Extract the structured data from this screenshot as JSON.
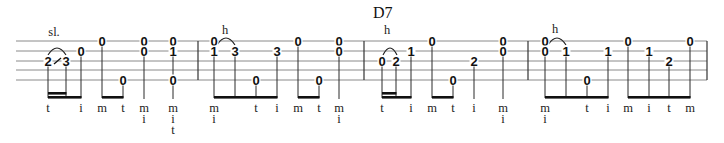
{
  "chord_symbol": {
    "label": "D7",
    "x": 373,
    "y": 18
  },
  "staff": {
    "x_start": 16,
    "x_end": 707,
    "string_y": [
      41,
      51,
      61,
      70,
      80
    ],
    "barlines": [
      198,
      364,
      528,
      707
    ]
  },
  "annotations": [
    {
      "label": "sl.",
      "x": 54,
      "y": 36
    },
    {
      "label": "h",
      "x": 225,
      "y": 34
    },
    {
      "label": "h",
      "x": 387,
      "y": 34
    },
    {
      "label": "h",
      "x": 555,
      "y": 33
    }
  ],
  "slurs": [
    {
      "x1": 48,
      "x2": 66,
      "y": 55,
      "peak": 47
    },
    {
      "x1": 217,
      "x2": 235,
      "y": 45,
      "peak": 37
    },
    {
      "x1": 383,
      "x2": 397,
      "y": 55,
      "peak": 47
    },
    {
      "x1": 548,
      "x2": 566,
      "y": 45,
      "peak": 37
    }
  ],
  "slides": [
    {
      "x1": 54,
      "x2": 61,
      "y1": 64,
      "y2": 58
    }
  ],
  "measures": [
    {
      "index": 1,
      "notes": [
        {
          "x": 48,
          "frets": [
            {
              "string": 3,
              "fret": "2"
            }
          ],
          "fingers": [
            "t"
          ],
          "beam": 1
        },
        {
          "x": 66,
          "frets": [
            {
              "string": 3,
              "fret": "3"
            }
          ],
          "fingers": [],
          "beam": 1
        },
        {
          "x": 81,
          "frets": [
            {
              "string": 2,
              "fret": "0"
            }
          ],
          "fingers": [
            "i"
          ],
          "beam": 1
        },
        {
          "x": 102,
          "frets": [
            {
              "string": 1,
              "fret": "0"
            }
          ],
          "fingers": [
            "m"
          ],
          "beam": 2
        },
        {
          "x": 123,
          "frets": [
            {
              "string": 5,
              "fret": "0"
            }
          ],
          "fingers": [
            "t"
          ],
          "beam": 2
        },
        {
          "x": 144,
          "frets": [
            {
              "string": 1,
              "fret": "0"
            },
            {
              "string": 2,
              "fret": "0"
            }
          ],
          "fingers": [
            "m",
            "i"
          ],
          "beam": 0
        },
        {
          "x": 173,
          "frets": [
            {
              "string": 1,
              "fret": "0"
            },
            {
              "string": 2,
              "fret": "1"
            },
            {
              "string": 5,
              "fret": "0"
            }
          ],
          "fingers": [
            "m",
            "i",
            "t"
          ],
          "beam": 0
        }
      ],
      "beams": [
        {
          "x1": 48,
          "x2": 66,
          "y": 92,
          "thick": 2.6
        },
        {
          "x1": 48,
          "x2": 81,
          "y": 96,
          "thick": 2.6
        },
        {
          "x1": 102,
          "x2": 123,
          "y": 96,
          "thick": 2.6
        }
      ]
    },
    {
      "index": 2,
      "notes": [
        {
          "x": 214,
          "frets": [
            {
              "string": 1,
              "fret": "0"
            },
            {
              "string": 2,
              "fret": "1"
            }
          ],
          "fingers": [
            "m",
            "i"
          ],
          "beam": 1
        },
        {
          "x": 235,
          "frets": [
            {
              "string": 2,
              "fret": "3"
            }
          ],
          "fingers": [],
          "beam": 1
        },
        {
          "x": 256,
          "frets": [
            {
              "string": 5,
              "fret": "0"
            }
          ],
          "fingers": [
            "t"
          ],
          "beam": 1
        },
        {
          "x": 277,
          "frets": [
            {
              "string": 2,
              "fret": "3"
            }
          ],
          "fingers": [
            "i"
          ],
          "beam": 1
        },
        {
          "x": 298,
          "frets": [
            {
              "string": 1,
              "fret": "0"
            }
          ],
          "fingers": [
            "m"
          ],
          "beam": 2
        },
        {
          "x": 319,
          "frets": [
            {
              "string": 5,
              "fret": "0"
            }
          ],
          "fingers": [
            "t"
          ],
          "beam": 2
        },
        {
          "x": 339,
          "frets": [
            {
              "string": 1,
              "fret": "0"
            },
            {
              "string": 2,
              "fret": "0"
            }
          ],
          "fingers": [
            "m",
            "i"
          ],
          "beam": 0
        }
      ],
      "beams": [
        {
          "x1": 214,
          "x2": 277,
          "y": 96,
          "thick": 2.6
        },
        {
          "x1": 298,
          "x2": 319,
          "y": 96,
          "thick": 2.6
        }
      ]
    },
    {
      "index": 3,
      "notes": [
        {
          "x": 382,
          "frets": [
            {
              "string": 3,
              "fret": "0"
            }
          ],
          "fingers": [
            "t"
          ],
          "beam": 1
        },
        {
          "x": 396,
          "frets": [
            {
              "string": 3,
              "fret": "2"
            }
          ],
          "fingers": [],
          "beam": 1
        },
        {
          "x": 411,
          "frets": [
            {
              "string": 2,
              "fret": "1"
            }
          ],
          "fingers": [
            "i"
          ],
          "beam": 1
        },
        {
          "x": 432,
          "frets": [
            {
              "string": 1,
              "fret": "0"
            }
          ],
          "fingers": [
            "m"
          ],
          "beam": 2
        },
        {
          "x": 453,
          "frets": [
            {
              "string": 5,
              "fret": "0"
            }
          ],
          "fingers": [
            "t"
          ],
          "beam": 2
        },
        {
          "x": 474,
          "frets": [
            {
              "string": 3,
              "fret": "2"
            }
          ],
          "fingers": [
            "i"
          ],
          "beam": 0
        },
        {
          "x": 503,
          "frets": [
            {
              "string": 1,
              "fret": "0"
            },
            {
              "string": 2,
              "fret": "0"
            }
          ],
          "fingers": [
            "m",
            "i"
          ],
          "beam": 0
        }
      ],
      "beams": [
        {
          "x1": 382,
          "x2": 396,
          "y": 92,
          "thick": 2.6
        },
        {
          "x1": 382,
          "x2": 411,
          "y": 96,
          "thick": 2.6
        },
        {
          "x1": 432,
          "x2": 453,
          "y": 96,
          "thick": 2.6
        }
      ]
    },
    {
      "index": 4,
      "notes": [
        {
          "x": 545,
          "frets": [
            {
              "string": 1,
              "fret": "0"
            },
            {
              "string": 2,
              "fret": "0"
            }
          ],
          "fingers": [
            "m",
            "i"
          ],
          "beam": 1
        },
        {
          "x": 566,
          "frets": [
            {
              "string": 2,
              "fret": "1"
            }
          ],
          "fingers": [],
          "beam": 1
        },
        {
          "x": 587,
          "frets": [
            {
              "string": 5,
              "fret": "0"
            }
          ],
          "fingers": [
            "t"
          ],
          "beam": 1
        },
        {
          "x": 608,
          "frets": [
            {
              "string": 2,
              "fret": "1"
            }
          ],
          "fingers": [
            "i"
          ],
          "beam": 1
        },
        {
          "x": 628,
          "frets": [
            {
              "string": 1,
              "fret": "0"
            }
          ],
          "fingers": [
            "m"
          ],
          "beam": 2
        },
        {
          "x": 649,
          "frets": [
            {
              "string": 2,
              "fret": "1"
            }
          ],
          "fingers": [
            "i"
          ],
          "beam": 2
        },
        {
          "x": 669,
          "frets": [
            {
              "string": 3,
              "fret": "2"
            }
          ],
          "fingers": [
            "t"
          ],
          "beam": 2
        },
        {
          "x": 690,
          "frets": [
            {
              "string": 1,
              "fret": "0"
            }
          ],
          "fingers": [
            "m"
          ],
          "beam": 2
        }
      ],
      "beams": [
        {
          "x1": 545,
          "x2": 608,
          "y": 96,
          "thick": 2.6
        },
        {
          "x1": 628,
          "x2": 690,
          "y": 96,
          "thick": 2.6
        }
      ]
    }
  ],
  "layout": {
    "stem_bottom_beamed": 98,
    "stem_bottom_quarter": 99,
    "finger_row_y": [
      112,
      123,
      134
    ]
  }
}
